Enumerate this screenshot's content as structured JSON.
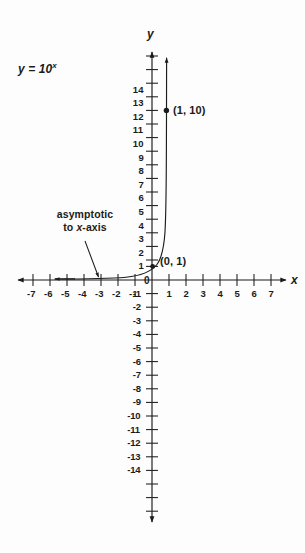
{
  "figure": {
    "background_color": "#fdfdfd",
    "ink_color": "#1b1b1b",
    "equation_label": "y = 10",
    "equation_exponent": "x",
    "axis_label_x": "x",
    "axis_label_y": "y",
    "annotation_line1": "asymptotic",
    "annotation_line2_pre": "to ",
    "annotation_line2_var": "x",
    "annotation_line2_post": "-axis",
    "point_label_origin": "(0, 1)",
    "point_label_marked": "(1, 10)",
    "origin_tick_label": "0"
  },
  "chart_data": {
    "type": "line",
    "title": "",
    "subtitle": "",
    "xlabel": "x",
    "ylabel": "y",
    "function": "y = 10^x",
    "xlim": [
      -7.9,
      7.9
    ],
    "ylim": [
      -14.9,
      14.9
    ],
    "grid": false,
    "legend": null,
    "x_ticks": [
      -7,
      -6,
      -5,
      -4,
      -3,
      -2,
      -1,
      1,
      2,
      3,
      4,
      5,
      6,
      7
    ],
    "x_tick_labels": [
      "-7",
      "-6",
      "-5",
      "-4",
      "-3",
      "-2",
      "-1",
      "1",
      "2",
      "3",
      "4",
      "5",
      "6",
      "7"
    ],
    "y_ticks": [
      14,
      13,
      12,
      11,
      10,
      9,
      8,
      7,
      6,
      5,
      4,
      3,
      2,
      1,
      -1,
      -2,
      -3,
      -4,
      -5,
      -6,
      -7,
      -8,
      -9,
      -10,
      -11,
      -12,
      -13,
      -14
    ],
    "y_tick_labels": [
      "14",
      "13",
      "12",
      "11",
      "10",
      "9",
      "8",
      "7",
      "6",
      "5",
      "4",
      "3",
      "2",
      "1",
      "-1",
      "-2",
      "-3",
      "-4",
      "-5",
      "-6",
      "-7",
      "-8",
      "-9",
      "-10",
      "-11",
      "-12",
      "-13",
      "-14"
    ],
    "series": [
      {
        "name": "y = 10^x",
        "x": [
          -6.0,
          -5.0,
          -4.0,
          -3.0,
          -2.5,
          -2.0,
          -1.5,
          -1.0,
          -0.75,
          -0.5,
          -0.25,
          0.0,
          0.15,
          0.3,
          0.45,
          0.6,
          0.75,
          0.9,
          1.0,
          1.1,
          1.15
        ],
        "y": [
          1e-06,
          1e-05,
          0.0001,
          0.001,
          0.00316,
          0.01,
          0.0316,
          0.1,
          0.178,
          0.316,
          0.562,
          1.0,
          1.413,
          1.995,
          2.818,
          3.981,
          5.623,
          7.943,
          10.0,
          12.589,
          14.13
        ]
      }
    ],
    "points": [
      {
        "label": "(0, 1)",
        "x": 0,
        "y": 1,
        "marker": "none"
      },
      {
        "label": "(1, 10)",
        "x": 1,
        "y": 10,
        "marker": "dot"
      }
    ],
    "annotations": [
      {
        "text": "asymptotic to x-axis",
        "pointer_from": [
          -3.9,
          2.8
        ],
        "pointer_to": [
          -3.2,
          0.1
        ]
      }
    ]
  }
}
